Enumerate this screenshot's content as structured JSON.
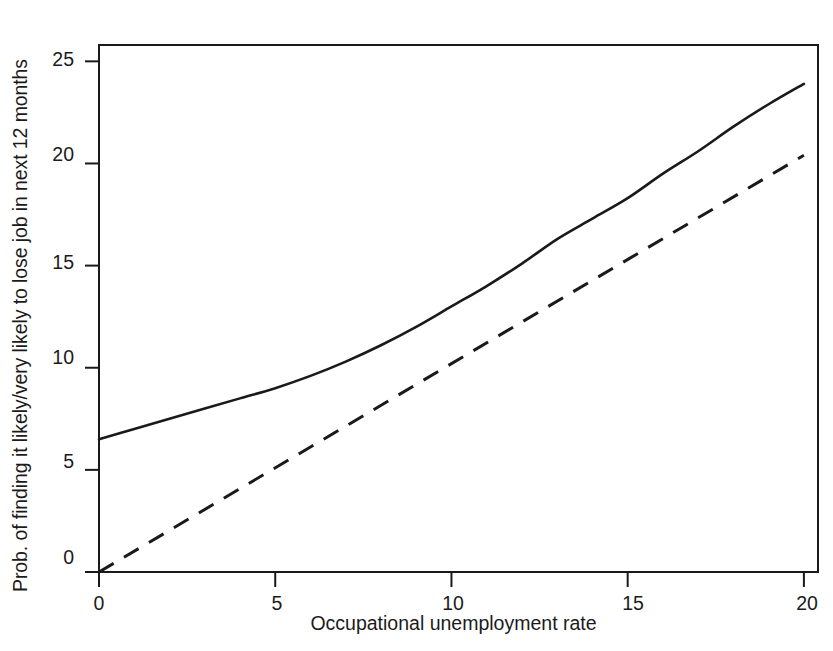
{
  "chart_data": {
    "type": "line",
    "title": "",
    "xlabel": "Occupational unemployment rate",
    "ylabel": "Prob. of finding it likely/very likely to lose job in next 12 months",
    "xlim": [
      0,
      20.4
    ],
    "ylim": [
      0,
      25.8
    ],
    "xticks": [
      0,
      5,
      10,
      15,
      20
    ],
    "xtick_labels": [
      "0",
      "5",
      "10",
      "15",
      "20"
    ],
    "yticks": [
      0,
      5,
      10,
      15,
      20,
      25
    ],
    "ytick_labels": [
      "0",
      "5",
      "10",
      "15",
      "20",
      "25"
    ],
    "grid": false,
    "legend": "none",
    "line_color": "#1a1a1a",
    "series": [
      {
        "name": "solid-curve",
        "style": "solid",
        "x": [
          0,
          1,
          2,
          3,
          4,
          5,
          6,
          7,
          8,
          9,
          10,
          11,
          12,
          13,
          14,
          15,
          16,
          17,
          18,
          19,
          20
        ],
        "values": [
          6.5,
          7.0,
          7.5,
          8.0,
          8.5,
          9.0,
          9.6,
          10.3,
          11.1,
          12.0,
          13.0,
          14.0,
          15.1,
          16.3,
          17.3,
          18.3,
          19.5,
          20.6,
          21.8,
          22.9,
          23.9
        ]
      },
      {
        "name": "dashed-line",
        "style": "dashed",
        "x": [
          0,
          20
        ],
        "values": [
          0,
          20.4
        ]
      }
    ]
  },
  "axes": {
    "ylabel": "Prob. of finding it likely/very likely to lose job in next 12 months",
    "xlabel": "Occupational unemployment rate",
    "xtick_labels": [
      "0",
      "5",
      "10",
      "15",
      "20"
    ],
    "ytick_labels": [
      "0",
      "5",
      "10",
      "15",
      "20",
      "25"
    ]
  }
}
